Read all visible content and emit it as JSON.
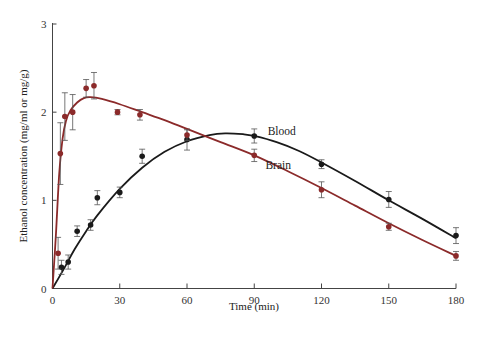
{
  "chart_data": {
    "type": "line",
    "title": "",
    "xlabel": "Time (min)",
    "ylabel": "Ethanol concentration (mg/ml or mg/g)",
    "xlim": [
      0,
      180
    ],
    "ylim": [
      0,
      3
    ],
    "x_ticks": [
      0,
      30,
      60,
      90,
      120,
      150,
      180
    ],
    "y_ticks": [
      0,
      1,
      2,
      3
    ],
    "grid": false,
    "legend": "inline labels",
    "series": [
      {
        "name": "Blood",
        "color": "#1a1a1a",
        "points": [
          {
            "x": 4,
            "y": 0.24,
            "err": 0.08
          },
          {
            "x": 7,
            "y": 0.3,
            "err": 0.08
          },
          {
            "x": 11,
            "y": 0.65,
            "err": 0.06
          },
          {
            "x": 17,
            "y": 0.72,
            "err": 0.06
          },
          {
            "x": 20,
            "y": 1.03,
            "err": 0.08
          },
          {
            "x": 30,
            "y": 1.09,
            "err": 0.06
          },
          {
            "x": 40,
            "y": 1.5,
            "err": 0.08
          },
          {
            "x": 60,
            "y": 1.69,
            "err": 0.12
          },
          {
            "x": 90,
            "y": 1.73,
            "err": 0.08
          },
          {
            "x": 120,
            "y": 1.41,
            "err": 0.05
          },
          {
            "x": 150,
            "y": 1.01,
            "err": 0.09
          },
          {
            "x": 180,
            "y": 0.6,
            "err": 0.09
          }
        ],
        "curve": [
          [
            0,
            0
          ],
          [
            5,
            0.22
          ],
          [
            10,
            0.45
          ],
          [
            15,
            0.65
          ],
          [
            20,
            0.83
          ],
          [
            30,
            1.13
          ],
          [
            40,
            1.37
          ],
          [
            50,
            1.55
          ],
          [
            60,
            1.67
          ],
          [
            70,
            1.74
          ],
          [
            77,
            1.76
          ],
          [
            85,
            1.75
          ],
          [
            90,
            1.73
          ],
          [
            100,
            1.66
          ],
          [
            110,
            1.56
          ],
          [
            120,
            1.43
          ],
          [
            135,
            1.22
          ],
          [
            150,
            1.0
          ],
          [
            165,
            0.79
          ],
          [
            180,
            0.57
          ]
        ],
        "label_pos": {
          "x": 96,
          "y": 1.74
        }
      },
      {
        "name": "Brain",
        "color": "#8b2a2a",
        "points": [
          {
            "x": 2.5,
            "y": 0.4,
            "err": 0.18
          },
          {
            "x": 3.5,
            "y": 1.53,
            "err": 0.35
          },
          {
            "x": 5.5,
            "y": 1.95,
            "err": 0.27
          },
          {
            "x": 9,
            "y": 2.0,
            "err": 0.2
          },
          {
            "x": 15,
            "y": 2.27,
            "err": 0.1
          },
          {
            "x": 18.5,
            "y": 2.3,
            "err": 0.15
          },
          {
            "x": 29,
            "y": 2.0,
            "err": 0.03
          },
          {
            "x": 39,
            "y": 1.97,
            "err": 0.06
          },
          {
            "x": 60,
            "y": 1.74,
            "err": 0.06
          },
          {
            "x": 90,
            "y": 1.51,
            "err": 0.07
          },
          {
            "x": 120,
            "y": 1.12,
            "err": 0.09
          },
          {
            "x": 150,
            "y": 0.7,
            "err": 0.04
          },
          {
            "x": 180,
            "y": 0.37,
            "err": 0.05
          }
        ],
        "curve": [
          [
            0,
            0
          ],
          [
            1.5,
            0.6
          ],
          [
            3,
            1.3
          ],
          [
            4.5,
            1.7
          ],
          [
            6,
            1.9
          ],
          [
            8,
            2.02
          ],
          [
            11,
            2.11
          ],
          [
            14,
            2.16
          ],
          [
            17,
            2.17
          ],
          [
            22,
            2.15
          ],
          [
            30,
            2.09
          ],
          [
            40,
            2.0
          ],
          [
            50,
            1.91
          ],
          [
            60,
            1.81
          ],
          [
            75,
            1.66
          ],
          [
            90,
            1.51
          ],
          [
            105,
            1.33
          ],
          [
            120,
            1.14
          ],
          [
            135,
            0.94
          ],
          [
            150,
            0.74
          ],
          [
            165,
            0.55
          ],
          [
            180,
            0.37
          ]
        ],
        "label_pos": {
          "x": 95,
          "y": 1.36
        }
      }
    ]
  }
}
